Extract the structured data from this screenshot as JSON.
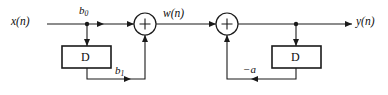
{
  "figure": {
    "kind": "signal-flow-block-diagram",
    "background_color": "#ffffff",
    "line_color": "#1a1a1a",
    "width": 388,
    "height": 95
  },
  "labels": {
    "input_signal": "x(n)",
    "intermediate_signal": "w(n)",
    "output_signal": "y(n)",
    "feedforward_gain_0": "b",
    "feedforward_gain_0_sub": "0",
    "feedforward_gain_1": "b",
    "feedforward_gain_1_sub": "1",
    "feedback_gain": "−a",
    "delay_block_left": "D",
    "delay_block_right": "D",
    "adder_left_symbol": "+",
    "adder_right_symbol": "+"
  },
  "nodes": {
    "input_port": {
      "x": 47,
      "y": 24
    },
    "tap_left": {
      "x": 87,
      "y": 24
    },
    "adder_left": {
      "x": 145,
      "y": 24,
      "r": 11
    },
    "adder_right": {
      "x": 227,
      "y": 24,
      "r": 11
    },
    "tap_right": {
      "x": 296,
      "y": 24
    },
    "output_port": {
      "x": 378,
      "y": 24
    },
    "delay_left": {
      "x": 62,
      "y": 46,
      "w": 49,
      "h": 22
    },
    "delay_right": {
      "x": 272,
      "y": 46,
      "w": 49,
      "h": 22
    },
    "feedback_rail_y": 79
  }
}
